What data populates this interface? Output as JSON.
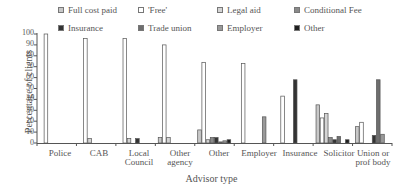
{
  "chart_data": {
    "type": "bar",
    "title": "",
    "xlabel": "Advisor type",
    "ylabel": "Percentage of clients",
    "ylim": [
      0,
      100
    ],
    "yticks": [
      0,
      10,
      20,
      30,
      40,
      50,
      60,
      70,
      80,
      90,
      100
    ],
    "grid": false,
    "legend_position": "top",
    "categories": [
      "Police",
      "CAB",
      "Local Council",
      "Other agency",
      "Other",
      "Employer",
      "Insurance",
      "Solicitor",
      "Union or prof body"
    ],
    "series": [
      {
        "name": "Full cost paid",
        "color": "#c8c8c8",
        "values": [
          0,
          0,
          0,
          5,
          12,
          0,
          0,
          35,
          15
        ]
      },
      {
        "name": "'Free'",
        "color": "#ffffff",
        "values": [
          100,
          96,
          96,
          90,
          74,
          73,
          43,
          23,
          19
        ]
      },
      {
        "name": "Legal aid",
        "color": "#d4d4d4",
        "values": [
          0,
          4,
          4,
          5,
          3,
          0,
          0,
          27,
          0
        ]
      },
      {
        "name": "Conditional Fee",
        "color": "#8a8a8a",
        "values": [
          0,
          0,
          0,
          0,
          5,
          0,
          0,
          5,
          0
        ]
      },
      {
        "name": "Insurance",
        "color": "#333333",
        "values": [
          0,
          0,
          4,
          0,
          5,
          0,
          58,
          3,
          7
        ]
      },
      {
        "name": "Trade union",
        "color": "#6e6e6e",
        "values": [
          0,
          0,
          0,
          0,
          1,
          0,
          0,
          6,
          58
        ]
      },
      {
        "name": "Employer",
        "color": "#999999",
        "values": [
          0,
          0,
          0,
          0,
          2,
          24,
          0,
          0,
          8
        ]
      },
      {
        "name": "Other",
        "color": "#1e1e1e",
        "values": [
          0,
          0,
          0,
          0,
          3,
          0,
          0,
          3,
          0
        ]
      }
    ]
  },
  "legend": {
    "items": [
      {
        "label": "Full cost paid"
      },
      {
        "label": "'Free'"
      },
      {
        "label": "Legal aid"
      },
      {
        "label": "Conditional Fee"
      },
      {
        "label": "Insurance"
      },
      {
        "label": "Trade union"
      },
      {
        "label": "Employer"
      },
      {
        "label": "Other"
      }
    ]
  },
  "axes": {
    "x_title": "Advisor type",
    "y_title": "Percentage of clients",
    "y_tick_labels": [
      "0",
      "10",
      "20",
      "30",
      "40",
      "50",
      "60",
      "70",
      "80",
      "90",
      "100"
    ],
    "x_tick_labels": [
      {
        "line1": "Police",
        "line2": ""
      },
      {
        "line1": "CAB",
        "line2": ""
      },
      {
        "line1": "Local",
        "line2": "Council"
      },
      {
        "line1": "Other",
        "line2": "agency"
      },
      {
        "line1": "Other",
        "line2": ""
      },
      {
        "line1": "Employer",
        "line2": ""
      },
      {
        "line1": "Insurance",
        "line2": ""
      },
      {
        "line1": "Solicitor",
        "line2": ""
      },
      {
        "line1": "Union or",
        "line2": "prof body"
      }
    ]
  }
}
